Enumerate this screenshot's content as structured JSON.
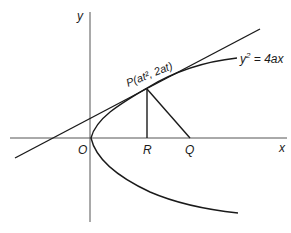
{
  "diagram": {
    "colors": {
      "stroke": "#1a1a1a",
      "axis": "#555555",
      "background": "#ffffff"
    },
    "axes": {
      "x_label": "x",
      "y_label": "y"
    },
    "points": {
      "origin": "O",
      "p_name": "P",
      "p_coords": "(at², 2at)",
      "r": "R",
      "q": "Q"
    },
    "curve": {
      "equation_lhs": "y",
      "equation_exp": "2",
      "equation_rhs": " = 4ax"
    }
  }
}
